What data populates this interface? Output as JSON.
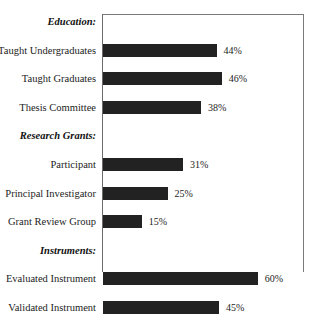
{
  "chart_data": {
    "type": "bar",
    "title": "",
    "subtitle": "",
    "xlabel": "",
    "ylabel": "",
    "orientation": "horizontal",
    "grid": false,
    "legend": null,
    "xlim": [
      0,
      80
    ],
    "value_suffix": "%",
    "sections": [
      {
        "heading": "Education:",
        "items": [
          {
            "label": "Taught Undergraduates",
            "value": 44,
            "value_label": "44%"
          },
          {
            "label": "Taught Graduates",
            "value": 46,
            "value_label": "46%"
          },
          {
            "label": "Thesis Committee",
            "value": 38,
            "value_label": "38%"
          }
        ]
      },
      {
        "heading": "Research Grants:",
        "items": [
          {
            "label": "Participant",
            "value": 31,
            "value_label": "31%"
          },
          {
            "label": "Principal Investigator",
            "value": 25,
            "value_label": "25%"
          },
          {
            "label": "Grant Review Group",
            "value": 15,
            "value_label": "15%"
          }
        ]
      },
      {
        "heading": "Instruments:",
        "items": [
          {
            "label": "Evaluated Instrument",
            "value": 60,
            "value_label": "60%"
          },
          {
            "label": "Validated Instrument",
            "value": 45,
            "value_label": "45%"
          }
        ]
      }
    ],
    "categories": [
      "Taught Undergraduates",
      "Taught Graduates",
      "Thesis Committee",
      "Participant",
      "Principal Investigator",
      "Grant Review Group",
      "Evaluated Instrument",
      "Validated Instrument"
    ],
    "values": [
      44,
      46,
      38,
      31,
      25,
      15,
      60,
      45
    ],
    "colors": {
      "bar": "#222222",
      "frame": "#7a7a7a",
      "text": "#1c1c1c",
      "background": "#ffffff"
    }
  }
}
